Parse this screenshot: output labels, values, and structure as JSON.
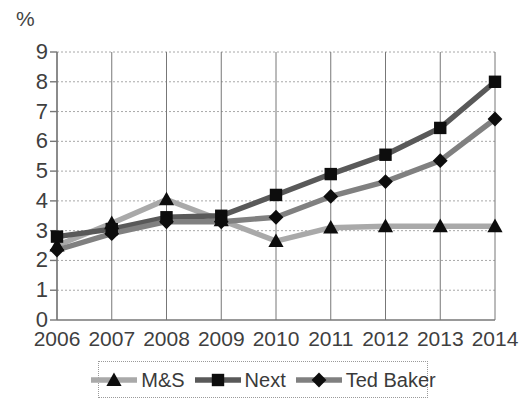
{
  "chart_data": {
    "type": "line",
    "title": "",
    "subtitle": "",
    "xlabel": "",
    "ylabel": "%",
    "unit_label": "%",
    "categories": [
      "2006",
      "2007",
      "2008",
      "2009",
      "2010",
      "2011",
      "2012",
      "2013",
      "2014"
    ],
    "x": [
      2006,
      2007,
      2008,
      2009,
      2010,
      2011,
      2012,
      2013,
      2014
    ],
    "ylim": [
      0,
      9
    ],
    "xlim": [
      2006,
      2014
    ],
    "yticks": [
      0,
      1,
      2,
      3,
      4,
      5,
      6,
      7,
      8,
      9
    ],
    "ytick_labels": [
      "0",
      "1",
      "2",
      "3",
      "4",
      "5",
      "6",
      "7",
      "8",
      "9"
    ],
    "grid": true,
    "grid_style": "dotted",
    "legend_position": "bottom",
    "series": [
      {
        "name": "M&S",
        "marker": "triangle",
        "color": "#a9a9a9",
        "values": [
          2.5,
          3.25,
          4.05,
          3.35,
          2.65,
          3.1,
          3.15,
          3.15,
          3.15
        ]
      },
      {
        "name": "Next",
        "marker": "square",
        "color": "#595959",
        "values": [
          2.8,
          3.05,
          3.45,
          3.5,
          4.2,
          4.9,
          5.55,
          6.45,
          8.0
        ]
      },
      {
        "name": "Ted Baker",
        "marker": "diamond",
        "color": "#808080",
        "values": [
          2.35,
          2.9,
          3.3,
          3.3,
          3.45,
          4.15,
          4.65,
          5.35,
          6.75
        ]
      }
    ]
  },
  "legend": {
    "items": [
      {
        "label": "M&S"
      },
      {
        "label": "Next"
      },
      {
        "label": "Ted Baker"
      }
    ]
  },
  "colors": {
    "ms": "#a9a9a9",
    "next": "#595959",
    "ted_baker": "#808080",
    "marker": "#0d0d0d",
    "grid": "#a8a8a8",
    "axis": "#777777",
    "text": "#3f3f3f",
    "background": "#ffffff"
  }
}
